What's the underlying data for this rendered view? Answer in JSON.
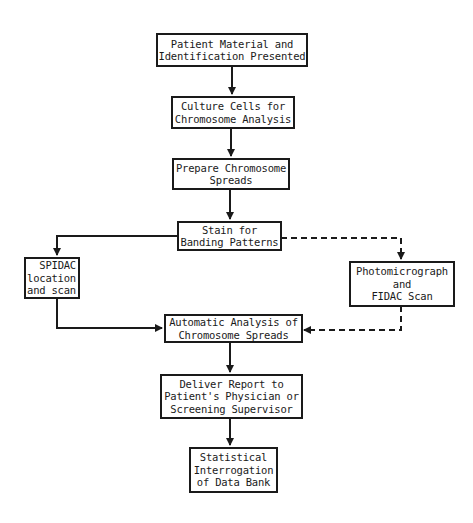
{
  "diagram": {
    "type": "flowchart",
    "colors": {
      "line": "#1a1a1a",
      "background": "#ffffff"
    },
    "nodes": [
      {
        "id": "patient_material",
        "lines": [
          "Patient Material and",
          "Identification Presented"
        ]
      },
      {
        "id": "culture_cells",
        "lines": [
          "Culture Cells for",
          "Chromosome Analysis"
        ]
      },
      {
        "id": "prepare_spreads",
        "lines": [
          "Prepare Chromosome",
          "Spreads"
        ]
      },
      {
        "id": "stain_banding",
        "lines": [
          "Stain for",
          "Banding Patterns"
        ]
      },
      {
        "id": "spidac",
        "lines": [
          "SPIDAC",
          "location",
          "and scan"
        ]
      },
      {
        "id": "photomicrograph",
        "lines": [
          "Photomicrograph",
          "and",
          "FIDAC Scan"
        ]
      },
      {
        "id": "automatic_analysis",
        "lines": [
          "Automatic Analysis of",
          "Chromosome Spreads"
        ]
      },
      {
        "id": "deliver_report",
        "lines": [
          "Deliver Report to",
          "Patient's Physician or",
          "Screening Supervisor"
        ]
      },
      {
        "id": "statistical_interrogation",
        "lines": [
          "Statistical",
          "Interrogation",
          "of Data Bank"
        ]
      }
    ],
    "edges": [
      {
        "from": "patient_material",
        "to": "culture_cells",
        "style": "solid"
      },
      {
        "from": "culture_cells",
        "to": "prepare_spreads",
        "style": "solid"
      },
      {
        "from": "prepare_spreads",
        "to": "stain_banding",
        "style": "solid"
      },
      {
        "from": "stain_banding",
        "to": "spidac",
        "style": "solid"
      },
      {
        "from": "stain_banding",
        "to": "photomicrograph",
        "style": "dashed"
      },
      {
        "from": "spidac",
        "to": "automatic_analysis",
        "style": "solid"
      },
      {
        "from": "photomicrograph",
        "to": "automatic_analysis",
        "style": "dashed"
      },
      {
        "from": "automatic_analysis",
        "to": "deliver_report",
        "style": "solid"
      },
      {
        "from": "deliver_report",
        "to": "statistical_interrogation",
        "style": "solid"
      }
    ]
  }
}
